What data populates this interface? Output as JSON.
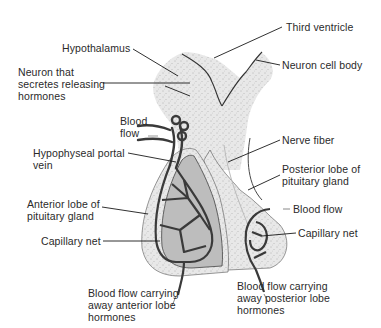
{
  "diagram": {
    "colors": {
      "background": "#ffffff",
      "tissue_stipple": "#e6e6e6",
      "anterior_lobe": "#bdbdbd",
      "vessel": "#3a3a3a",
      "leader_line": "#1a1a1a",
      "text": "#2a2a2a"
    },
    "labels": {
      "hypothalamus": "Hypothalamus",
      "third_ventricle": "Third ventricle",
      "neuron_cell_body": "Neuron cell body",
      "neuron_secretes": "Neuron that\nsecretes releasing\nhormones",
      "blood_flow_top": "Blood\nflow",
      "hypophyseal_portal_vein": "Hypophyseal portal\nvein",
      "nerve_fiber": "Nerve fiber",
      "posterior_lobe": "Posterior lobe of\npituitary gland",
      "blood_flow_right": "Blood flow",
      "anterior_lobe": "Anterior lobe of\npituitary gland",
      "capillary_net_left": "Capillary net",
      "capillary_net_right": "Capillary net",
      "blood_flow_anterior_out": "Blood flow carrying\naway anterior lobe\nhormones",
      "blood_flow_posterior_out": "Blood flow carrying\naway posterior lobe\nhormones"
    }
  }
}
